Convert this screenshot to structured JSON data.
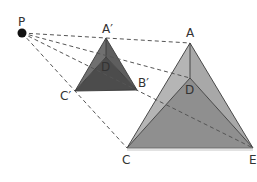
{
  "diagram": {
    "type": "perspective-projection",
    "center": {
      "label": "P",
      "x": 22,
      "y": 33
    },
    "small_pyramid": {
      "vertices": {
        "A": {
          "label": "A′",
          "x": 106,
          "y": 38
        },
        "D": {
          "label": "D",
          "x": 106,
          "y": 57
        },
        "C": {
          "label": "C′",
          "x": 75,
          "y": 91
        },
        "B": {
          "label": "B′",
          "x": 137,
          "y": 90
        }
      },
      "colors": {
        "left_face": "#6e6e6e",
        "right_face": "#5a5a5a",
        "front_face": "#4a4a4a"
      }
    },
    "large_pyramid": {
      "vertices": {
        "A": {
          "label": "A",
          "x": 190,
          "y": 43
        },
        "D": {
          "label": "D",
          "x": 190,
          "y": 78
        },
        "C": {
          "label": "C",
          "x": 127,
          "y": 148
        },
        "E": {
          "label": "E",
          "x": 253,
          "y": 148
        }
      },
      "colors": {
        "left_face": "#b3b3b3",
        "right_face": "#a6a6a6",
        "front_face": "#8e8e8e"
      }
    },
    "labels": {
      "P": "P",
      "A_prime": "A′",
      "B_prime": "B′",
      "C_prime": "C′",
      "D_prime": "D",
      "A": "A",
      "C": "C",
      "D": "D",
      "E": "E"
    }
  }
}
